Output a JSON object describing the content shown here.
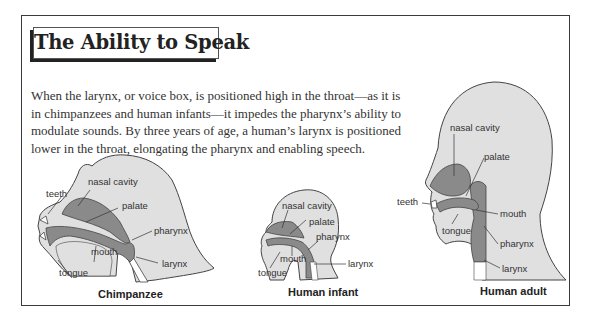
{
  "title": "The Ability to Speak",
  "body_lines": [
    "When the larynx, or voice box, is positioned high in the throat—as it is",
    "in chimpanzees and human infants—it impedes the pharynx’s ability to",
    "modulate sounds. By three years of age, a human’s larynx is positioned",
    "lower in the throat, elongating the pharynx and enabling speech."
  ],
  "colors": {
    "frame": "#3a3a3a",
    "head_fill": "#e0e0e0",
    "cavity_fill": "#8a8a8a",
    "outline": "#444444"
  },
  "figures": [
    {
      "caption": "Chimpanzee",
      "labels": {
        "teeth": "teeth",
        "nasal_cavity": "nasal cavity",
        "palate": "palate",
        "pharynx": "pharynx",
        "mouth": "mouth",
        "larynx": "larynx",
        "tongue": "tongue"
      }
    },
    {
      "caption": "Human infant",
      "labels": {
        "nasal_cavity": "nasal cavity",
        "palate": "palate",
        "pharynx": "pharynx",
        "mouth": "mouth",
        "larynx": "larynx",
        "tongue": "tongue"
      }
    },
    {
      "caption": "Human adult",
      "labels": {
        "nasal_cavity": "nasal cavity",
        "palate": "palate",
        "teeth": "teeth",
        "mouth": "mouth",
        "tongue": "tongue",
        "pharynx": "pharynx",
        "larynx": "larynx"
      }
    }
  ]
}
